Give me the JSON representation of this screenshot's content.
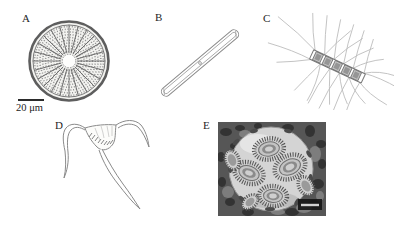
{
  "figure": {
    "panels": [
      {
        "label": "A",
        "organism": "centric-diatom-drawing"
      },
      {
        "label": "B",
        "organism": "pennate-diatom-drawing"
      },
      {
        "label": "C",
        "organism": "chain-forming-diatom-drawing"
      },
      {
        "label": "D",
        "organism": "horned-dinoflagellate-drawing"
      },
      {
        "label": "E",
        "organism": "coccolithophore-sem-micrograph"
      }
    ],
    "scale_bar_text": "20 μm",
    "colors": {
      "background": "#ffffff",
      "label_text": "#1f1f1f",
      "sketch_stroke": "#8a8a8a",
      "diatom_rim": "#5e5e5e",
      "sem_background": "#565656",
      "sem_dark_pores": "#2e2e2e",
      "sem_sphere": "#d4d4d4",
      "sem_scalebox": "#151515"
    }
  }
}
